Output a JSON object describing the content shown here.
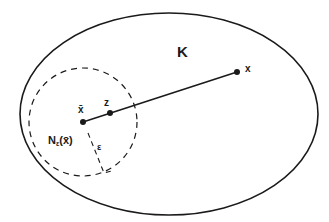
{
  "diagram": {
    "set_label": "K",
    "point_x_label": "x",
    "point_xbar_label": "x̄",
    "point_z_label": "z",
    "neighborhood_label": "N",
    "neighborhood_sub": "ε",
    "neighborhood_arg": "(x̄)",
    "radius_label": "ε",
    "colors": {
      "stroke": "#1a1a1a",
      "background": "#ffffff"
    }
  }
}
